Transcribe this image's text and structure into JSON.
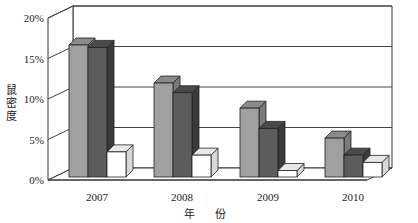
{
  "chart_data": {
    "type": "bar",
    "style": "3d-clustered-column",
    "title": "",
    "xlabel": "年 份",
    "ylabel": "鼠密度",
    "categories": [
      "2007",
      "2008",
      "2009",
      "2010"
    ],
    "series": [
      {
        "name": "series-1",
        "color": "#a0a0a0",
        "side": "#7a7a7a",
        "top": "#8a8a8a",
        "values": [
          16.3,
          11.6,
          8.5,
          4.8
        ]
      },
      {
        "name": "series-2",
        "color": "#5c5c5c",
        "side": "#3a3a3a",
        "top": "#4a4a4a",
        "values": [
          16.0,
          10.4,
          6.0,
          2.7
        ]
      },
      {
        "name": "series-3",
        "color": "#ffffff",
        "side": "#d8d8d8",
        "top": "#e8e8e8",
        "values": [
          3.1,
          2.7,
          0.8,
          1.8
        ]
      }
    ],
    "yticks": [
      "0%",
      "5%",
      "10%",
      "15%",
      "20%"
    ],
    "ylim": [
      0,
      20
    ],
    "grid": true,
    "legend": "none"
  }
}
